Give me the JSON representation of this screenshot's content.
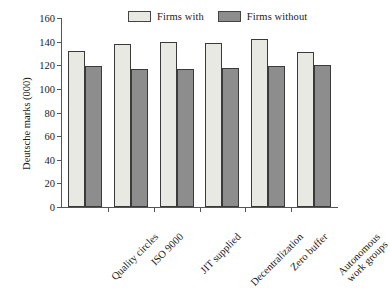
{
  "chart_data": {
    "type": "bar",
    "title": "",
    "subtitle": "",
    "xlabel": "",
    "ylabel": "Deutsche marks (000)",
    "ylim": [
      0,
      160
    ],
    "yticks": [
      0,
      20,
      40,
      60,
      80,
      100,
      120,
      140,
      160
    ],
    "ytick_labels": [
      "0",
      "20",
      "40",
      "60",
      "80",
      "100",
      "120",
      "140",
      "160"
    ],
    "grid": false,
    "legend_position": "top",
    "categories": [
      "Quality circles",
      "ISO 9000",
      "JIT supplied",
      "Decentralization",
      "Zero buffer",
      "Autonomous work groups"
    ],
    "category_lines": [
      [
        "Quality circles"
      ],
      [
        "ISO 9000"
      ],
      [
        "JIT supplied"
      ],
      [
        "Decentralization"
      ],
      [
        "Zero buffer"
      ],
      [
        "Autonomous",
        "work groups"
      ]
    ],
    "series": [
      {
        "name": "Firms with",
        "color": "#e9e9e4",
        "values": [
          132,
          138,
          140,
          139,
          142,
          131
        ]
      },
      {
        "name": "Firms without",
        "color": "#8d8d8d",
        "values": [
          119,
          117,
          117,
          118,
          119,
          120
        ]
      }
    ]
  },
  "legend": {
    "entries": [
      {
        "label": "Firms with",
        "color": "#e9e9e4"
      },
      {
        "label": "Firms without",
        "color": "#8d8d8d"
      }
    ]
  },
  "colors": {
    "axis": "#555555",
    "bar_outline": "#3a3a3a",
    "text": "#1a1a1a",
    "background": "#ffffff"
  }
}
